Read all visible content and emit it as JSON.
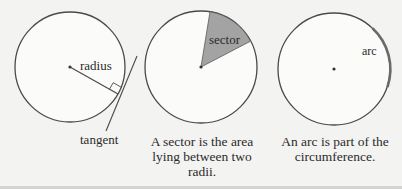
{
  "diagrams": [
    {
      "id": "radius-tangent",
      "labels": {
        "radius": "radius",
        "tangent": "tangent"
      },
      "caption": ""
    },
    {
      "id": "sector",
      "labels": {
        "sector": "sector"
      },
      "caption": "A sector is the area lying between two radii."
    },
    {
      "id": "arc",
      "labels": {
        "arc": "arc"
      },
      "caption": "An arc is part of the circumference."
    }
  ],
  "colors": {
    "background": "#f3f3f2",
    "stroke": "#4a4a4a",
    "sector_fill": "#a3a3a3",
    "arc_highlight": "#777777"
  }
}
